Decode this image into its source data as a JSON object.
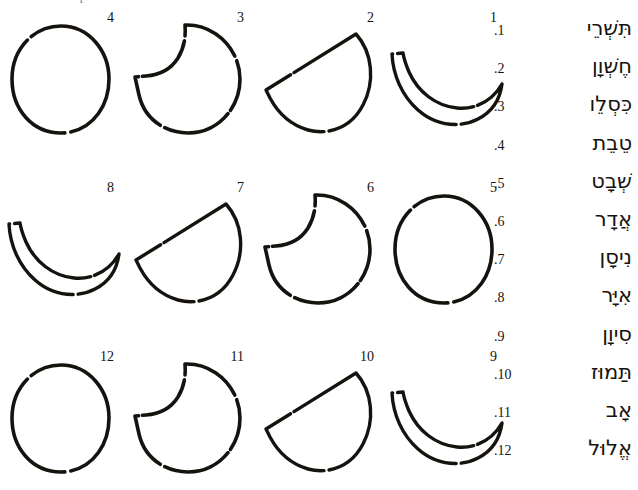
{
  "page": {
    "caption": "what the shapes in the first half"
  },
  "moon_chart": {
    "rows": [
      {
        "cells": [
          {
            "number": "4",
            "phase": "full-moon"
          },
          {
            "number": "3",
            "phase": "waning-gibbous"
          },
          {
            "number": "2",
            "phase": "half-moon"
          },
          {
            "number": "1",
            "phase": "crescent-moon"
          }
        ]
      },
      {
        "cells": [
          {
            "number": "8",
            "phase": "crescent-moon"
          },
          {
            "number": "7",
            "phase": "half-moon"
          },
          {
            "number": "6",
            "phase": "waning-gibbous"
          },
          {
            "number": "5",
            "phase": "full-moon"
          }
        ]
      },
      {
        "cells": [
          {
            "number": "12",
            "phase": "full-moon"
          },
          {
            "number": "11",
            "phase": "waning-gibbous"
          },
          {
            "number": "10",
            "phase": "half-moon"
          },
          {
            "number": "9",
            "phase": "crescent-moon"
          }
        ]
      }
    ]
  },
  "month_list": {
    "items": [
      {
        "index": ".1",
        "name": "תִּשְׁרֵי"
      },
      {
        "index": ".2",
        "name": "חֶשְׁוָן"
      },
      {
        "index": ".3",
        "name": "כִּסְלֵו"
      },
      {
        "index": ".4",
        "name": "טֵבֵת"
      },
      {
        "index": ".5",
        "name": "שְׁבָט"
      },
      {
        "index": ".6",
        "name": "אֲדָר"
      },
      {
        "index": ".7",
        "name": "נִיסָן"
      },
      {
        "index": ".8",
        "name": "אִיָּר"
      },
      {
        "index": ".9",
        "name": "סִיוָן"
      },
      {
        "index": ".10",
        "name": "תַּמוּז"
      },
      {
        "index": ".11",
        "name": "אָב"
      },
      {
        "index": ".12",
        "name": "אֱלוּל"
      }
    ]
  }
}
